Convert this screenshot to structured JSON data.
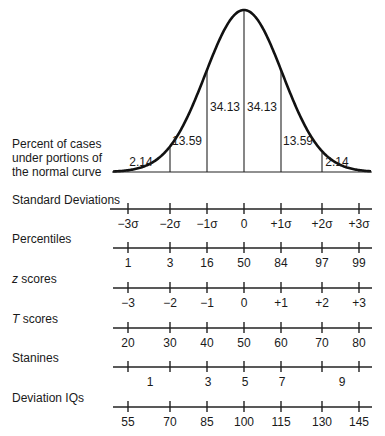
{
  "curve": {
    "label_lines": [
      "Percent of cases",
      "under portions of",
      "the normal curve"
    ],
    "segments": [
      {
        "label": "2.14",
        "x": 141,
        "y": 166
      },
      {
        "label": "13.59",
        "x": 187,
        "y": 145
      },
      {
        "label": "34.13",
        "x": 225,
        "y": 111
      },
      {
        "label": "34.13",
        "x": 262,
        "y": 111
      },
      {
        "label": "13.59",
        "x": 298,
        "y": 145
      },
      {
        "label": "2.14",
        "x": 337,
        "y": 166
      }
    ]
  },
  "scales": [
    {
      "name": "Standard Deviations",
      "italic_prefix": "",
      "rest": "Standard Deviations",
      "line_y": 209,
      "ticks": [
        "−3σ",
        "−2σ",
        "−1σ",
        "0",
        "+1σ",
        "+2σ",
        "+3σ"
      ]
    },
    {
      "name": "Percentiles",
      "italic_prefix": "",
      "rest": "Percentiles",
      "line_y": 248,
      "ticks": [
        "1",
        "3",
        "16",
        "50",
        "84",
        "97",
        "99"
      ]
    },
    {
      "name": "z scores",
      "italic_prefix": "z",
      "rest": " scores",
      "line_y": 288,
      "ticks": [
        "−3",
        "−2",
        "−1",
        "0",
        "+1",
        "+2",
        "+3"
      ]
    },
    {
      "name": "T scores",
      "italic_prefix": "T",
      "rest": " scores",
      "line_y": 328,
      "ticks": [
        "20",
        "30",
        "40",
        "50",
        "60",
        "70",
        "80"
      ]
    },
    {
      "name": "Stanines",
      "italic_prefix": "",
      "rest": "Stanines",
      "line_y": 367,
      "ticks": [],
      "offset_labels": [
        {
          "label": "1",
          "x": 150
        },
        {
          "label": "3",
          "x": 208
        },
        {
          "label": "5",
          "x": 245
        },
        {
          "label": "7",
          "x": 282
        },
        {
          "label": "9",
          "x": 342
        }
      ]
    },
    {
      "name": "Deviation IQs",
      "italic_prefix": "",
      "rest": "Deviation IQs",
      "line_y": 407,
      "ticks": [
        "55",
        "70",
        "85",
        "100",
        "115",
        "130",
        "145"
      ]
    }
  ],
  "tick_x": [
    128,
    170,
    207,
    244,
    281,
    322,
    359
  ],
  "chart_data": {
    "type": "area",
    "curve_segments_percent": [
      {
        "range": "-3σ to -2σ",
        "value": 2.14
      },
      {
        "range": "-2σ to -1σ",
        "value": 13.59
      },
      {
        "range": "-1σ to 0",
        "value": 34.13
      },
      {
        "range": "0 to +1σ",
        "value": 34.13
      },
      {
        "range": "+1σ to +2σ",
        "value": 13.59
      },
      {
        "range": "+2σ to +3σ",
        "value": 2.14
      }
    ],
    "x": [
      "-3σ",
      "-2σ",
      "-1σ",
      "0",
      "+1σ",
      "+2σ",
      "+3σ"
    ],
    "scales": {
      "Standard Deviations": [
        "-3σ",
        "-2σ",
        "-1σ",
        "0",
        "+1σ",
        "+2σ",
        "+3σ"
      ],
      "Percentiles": [
        1,
        3,
        16,
        50,
        84,
        97,
        99
      ],
      "z scores": [
        -3,
        -2,
        -1,
        0,
        1,
        2,
        3
      ],
      "T scores": [
        20,
        30,
        40,
        50,
        60,
        70,
        80
      ],
      "Stanines": [
        1,
        3,
        5,
        7,
        9
      ],
      "Deviation IQs": [
        55,
        70,
        85,
        100,
        115,
        130,
        145
      ]
    }
  }
}
